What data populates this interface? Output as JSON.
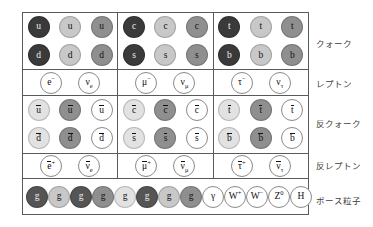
{
  "row_labels": {
    "quark": "クォーク",
    "lepton": "レプトン",
    "antiquark": "反クォーク",
    "antilepton": "反レプトン",
    "boson": "ボース粒子"
  },
  "rows": [
    {
      "key": "quark",
      "label": "クォーク",
      "type": "fermion",
      "generations": [
        {
          "index": 1,
          "upper": [
            {
              "symbol": "u",
              "shade": "vdark",
              "fill": "filled"
            },
            {
              "symbol": "u",
              "shade": "light",
              "fill": "filled"
            },
            {
              "symbol": "u",
              "shade": "mid",
              "fill": "filled"
            }
          ],
          "lower": [
            {
              "symbol": "d",
              "shade": "vdark",
              "fill": "filled"
            },
            {
              "symbol": "d",
              "shade": "light",
              "fill": "filled"
            },
            {
              "symbol": "d",
              "shade": "mid",
              "fill": "filled"
            }
          ]
        },
        {
          "index": 2,
          "upper": [
            {
              "symbol": "c",
              "shade": "vdark",
              "fill": "filled"
            },
            {
              "symbol": "c",
              "shade": "light",
              "fill": "filled"
            },
            {
              "symbol": "c",
              "shade": "mid",
              "fill": "filled"
            }
          ],
          "lower": [
            {
              "symbol": "s",
              "shade": "vdark",
              "fill": "filled"
            },
            {
              "symbol": "s",
              "shade": "light",
              "fill": "filled"
            },
            {
              "symbol": "s",
              "shade": "mid",
              "fill": "filled"
            }
          ]
        },
        {
          "index": 3,
          "upper": [
            {
              "symbol": "t",
              "shade": "vdark",
              "fill": "filled"
            },
            {
              "symbol": "t",
              "shade": "light",
              "fill": "filled"
            },
            {
              "symbol": "t",
              "shade": "mid",
              "fill": "filled"
            }
          ],
          "lower": [
            {
              "symbol": "b",
              "shade": "vdark",
              "fill": "filled"
            },
            {
              "symbol": "b",
              "shade": "light",
              "fill": "filled"
            },
            {
              "symbol": "b",
              "shade": "mid",
              "fill": "filled"
            }
          ]
        }
      ]
    },
    {
      "key": "lepton",
      "label": "レプトン",
      "type": "lepton",
      "generations": [
        {
          "index": 1,
          "particles": [
            {
              "base": "e",
              "sup": "−",
              "sub": "",
              "fill": "open"
            },
            {
              "base": "ν",
              "sup": "",
              "sub": "e",
              "fill": "open"
            }
          ]
        },
        {
          "index": 2,
          "particles": [
            {
              "base": "μ",
              "sup": "−",
              "sub": "",
              "fill": "open"
            },
            {
              "base": "ν",
              "sup": "",
              "sub": "μ",
              "fill": "open"
            }
          ]
        },
        {
          "index": 3,
          "particles": [
            {
              "base": "τ",
              "sup": "−",
              "sub": "",
              "fill": "open"
            },
            {
              "base": "ν",
              "sup": "",
              "sub": "τ",
              "fill": "open"
            }
          ]
        }
      ]
    },
    {
      "key": "antiquark",
      "label": "反クォーク",
      "type": "fermion",
      "generations": [
        {
          "index": 1,
          "upper": [
            {
              "symbol": "u",
              "shade": "vlight",
              "fill": "filled",
              "bar": true
            },
            {
              "symbol": "u",
              "shade": "mid",
              "fill": "filled",
              "bar": true
            },
            {
              "symbol": "u",
              "shade": "white",
              "fill": "open",
              "bar": true
            }
          ],
          "lower": [
            {
              "symbol": "d",
              "shade": "vlight",
              "fill": "filled",
              "bar": true
            },
            {
              "symbol": "d",
              "shade": "mid",
              "fill": "filled",
              "bar": true
            },
            {
              "symbol": "d",
              "shade": "white",
              "fill": "open",
              "bar": true
            }
          ]
        },
        {
          "index": 2,
          "upper": [
            {
              "symbol": "c",
              "shade": "vlight",
              "fill": "filled",
              "bar": true
            },
            {
              "symbol": "c",
              "shade": "mid",
              "fill": "filled",
              "bar": true
            },
            {
              "symbol": "c",
              "shade": "white",
              "fill": "open",
              "bar": true
            }
          ],
          "lower": [
            {
              "symbol": "s",
              "shade": "vlight",
              "fill": "filled",
              "bar": true
            },
            {
              "symbol": "s",
              "shade": "mid",
              "fill": "filled",
              "bar": true
            },
            {
              "symbol": "s",
              "shade": "white",
              "fill": "open",
              "bar": true
            }
          ]
        },
        {
          "index": 3,
          "upper": [
            {
              "symbol": "t",
              "shade": "vlight",
              "fill": "filled",
              "bar": true
            },
            {
              "symbol": "t",
              "shade": "mid",
              "fill": "filled",
              "bar": true
            },
            {
              "symbol": "t",
              "shade": "white",
              "fill": "open",
              "bar": true
            }
          ],
          "lower": [
            {
              "symbol": "b",
              "shade": "vlight",
              "fill": "filled",
              "bar": true
            },
            {
              "symbol": "b",
              "shade": "mid",
              "fill": "filled",
              "bar": true
            },
            {
              "symbol": "b",
              "shade": "white",
              "fill": "open",
              "bar": true
            }
          ]
        }
      ]
    },
    {
      "key": "antilepton",
      "label": "反レプトン",
      "type": "lepton",
      "generations": [
        {
          "index": 1,
          "particles": [
            {
              "base": "e",
              "sup": "+",
              "sub": "",
              "fill": "open",
              "bar": true
            },
            {
              "base": "ν",
              "sup": "",
              "sub": "e",
              "fill": "open",
              "bar": true
            }
          ]
        },
        {
          "index": 2,
          "particles": [
            {
              "base": "μ",
              "sup": "+",
              "sub": "",
              "fill": "open",
              "bar": true
            },
            {
              "base": "ν",
              "sup": "",
              "sub": "μ",
              "fill": "open",
              "bar": true
            }
          ]
        },
        {
          "index": 3,
          "particles": [
            {
              "base": "τ",
              "sup": "+",
              "sub": "",
              "fill": "open",
              "bar": true
            },
            {
              "base": "ν",
              "sup": "",
              "sub": "τ",
              "fill": "open",
              "bar": true
            }
          ]
        }
      ]
    },
    {
      "key": "boson",
      "label": "ボース粒子",
      "type": "boson",
      "particles": [
        {
          "base": "g",
          "sup": "",
          "shade": "dark",
          "fill": "filled"
        },
        {
          "base": "g",
          "sup": "",
          "shade": "light",
          "fill": "filled"
        },
        {
          "base": "g",
          "sup": "",
          "shade": "dark",
          "fill": "filled"
        },
        {
          "base": "g",
          "sup": "",
          "shade": "mid",
          "fill": "filled"
        },
        {
          "base": "g",
          "sup": "",
          "shade": "vlight",
          "fill": "filled"
        },
        {
          "base": "g",
          "sup": "",
          "shade": "dark",
          "fill": "filled"
        },
        {
          "base": "g",
          "sup": "",
          "shade": "light",
          "fill": "filled"
        },
        {
          "base": "g",
          "sup": "",
          "shade": "mid",
          "fill": "filled"
        },
        {
          "base": "γ",
          "sup": "",
          "shade": "white",
          "fill": "open"
        },
        {
          "base": "W",
          "sup": "+",
          "shade": "white",
          "fill": "open"
        },
        {
          "base": "W",
          "sup": "−",
          "shade": "white",
          "fill": "open"
        },
        {
          "base": "Z",
          "sup": "0",
          "shade": "white",
          "fill": "open"
        },
        {
          "base": "H",
          "sup": "",
          "shade": "white",
          "fill": "open"
        }
      ]
    }
  ]
}
